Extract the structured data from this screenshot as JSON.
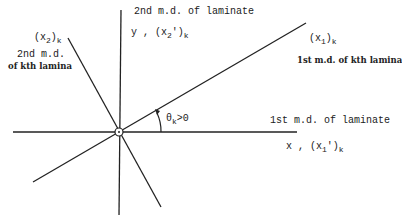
{
  "diagram": {
    "type": "coordinate-rotation",
    "labels": {
      "laminate_2nd_md": "2nd m.d. of laminate",
      "y_axis_prefix": "y , (x",
      "y_axis_sub": "2",
      "y_axis_suffix": "')",
      "y_axis_k": "k",
      "lamina_x2_prefix": "(x",
      "lamina_x2_sub": "2",
      "lamina_x2_suffix": ")",
      "lamina_x2_k": "k",
      "lamina_2nd_md_line1": "2nd m.d.",
      "lamina_2nd_md_line2": "of kth lamina",
      "lamina_x1_prefix": "(x",
      "lamina_x1_sub": "1",
      "lamina_x1_suffix": ")",
      "lamina_x1_k": "k",
      "lamina_1st_md": "1st m.d. of kth lamina",
      "laminate_1st_md": "1st m.d. of laminate",
      "x_axis_prefix": "x , (x",
      "x_axis_sub": "1",
      "x_axis_suffix": "')",
      "x_axis_k": "k",
      "theta": "θ",
      "theta_sub": "k",
      "theta_cond": ">0"
    },
    "colors": {
      "line": "#222222",
      "background": "#ffffff"
    }
  }
}
